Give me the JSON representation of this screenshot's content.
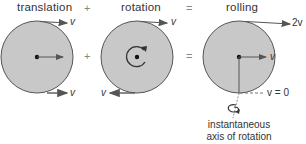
{
  "panels": [
    {
      "title": "translation",
      "center_arrow": "v",
      "top_arrow": "v",
      "bottom_arrow": "v"
    },
    {
      "title": "rotation",
      "top_arrow": "v",
      "bottom_arrow": "v"
    },
    {
      "title": "rolling",
      "top_arrow": "2v",
      "center_arrow": "v",
      "bottom_label": "v = 0"
    }
  ],
  "operators": {
    "plus": "+",
    "equals": "="
  },
  "caption": {
    "line1": "instantaneous",
    "line2": "axis of rotation"
  },
  "colors": {
    "disk_fill": "#c8c8c8",
    "disk_stroke": "#555555",
    "arrow": "#555555"
  }
}
